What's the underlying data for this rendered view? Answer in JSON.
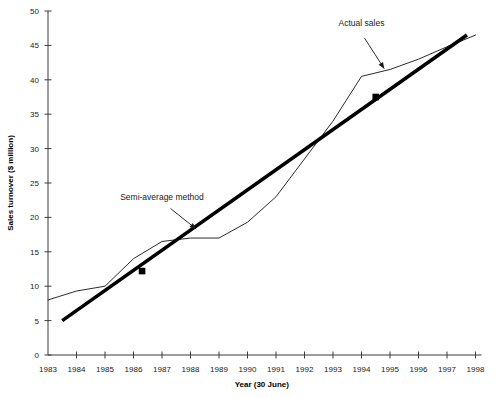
{
  "chart_data": {
    "type": "line",
    "title": "",
    "xlabel": "Year (30 June)",
    "ylabel": "Sales turnover ($ million)",
    "xlim": [
      1983,
      1998
    ],
    "ylim": [
      0,
      50
    ],
    "grid": false,
    "legend_position": "none",
    "x_tick_labels": [
      "1983",
      "1984",
      "1985",
      "1986",
      "1987",
      "1988",
      "1989",
      "1990",
      "1991",
      "1992",
      "1993",
      "1994",
      "1995",
      "1996",
      "1997",
      "1998"
    ],
    "y_tick_labels": [
      "0",
      "5",
      "10",
      "15",
      "20",
      "25",
      "30",
      "35",
      "40",
      "45",
      "50"
    ],
    "y_tick_values": [
      0,
      5,
      10,
      15,
      20,
      25,
      30,
      35,
      40,
      45,
      50
    ],
    "x_tick_values": [
      1983,
      1984,
      1985,
      1986,
      1987,
      1988,
      1989,
      1990,
      1991,
      1992,
      1993,
      1994,
      1995,
      1996,
      1997,
      1998
    ],
    "series": [
      {
        "name": "Actual sales",
        "style": "thin-line",
        "x": [
          1983,
          1984,
          1985,
          1986,
          1987,
          1988,
          1989,
          1990,
          1991,
          1992,
          1993,
          1994,
          1995,
          1996,
          1997,
          1998
        ],
        "values": [
          8,
          9.3,
          10,
          14,
          16.5,
          17,
          17,
          19.3,
          23,
          28.5,
          34,
          40.5,
          41.5,
          43,
          44.8,
          46.5
        ]
      },
      {
        "name": "Semi-average method",
        "style": "thick-trend-line",
        "x": [
          1983.5,
          1997.7
        ],
        "values": [
          5,
          46.5
        ],
        "markers": [
          {
            "x": 1986.3,
            "y": 12.2
          },
          {
            "x": 1994.5,
            "y": 37.5
          }
        ]
      }
    ],
    "annotations": [
      {
        "label": "Actual sales",
        "text_x": 1994.0,
        "text_y": 47.8,
        "arrow_from_x": 1994.1,
        "arrow_from_y": 46.1,
        "arrow_to_x": 1994.8,
        "arrow_to_y": 41.6
      },
      {
        "label": "Semi-average method",
        "text_x": 1987.0,
        "text_y": 22.6,
        "arrow_from_x": 1987.3,
        "arrow_from_y": 21.3,
        "arrow_to_x": 1988.2,
        "arrow_to_y": 18.3
      }
    ]
  }
}
